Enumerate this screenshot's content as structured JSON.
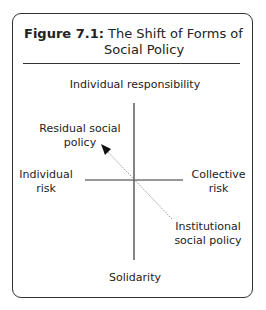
{
  "figure": {
    "label": "Figure 7.1:",
    "title_line1": "The Shift of Forms of",
    "title_line2": "Social Policy"
  },
  "axes": {
    "top": "Individual responsibility",
    "bottom": "Solidarity",
    "left_line1": "Individual",
    "left_line2": "risk",
    "right_line1": "Collective",
    "right_line2": "risk"
  },
  "points": {
    "residual_line1": "Residual social",
    "residual_line2": "policy",
    "institutional_line1": "Institutional",
    "institutional_line2": "social policy"
  },
  "arrow": {
    "from": "Institutional social policy",
    "to": "Residual social policy"
  }
}
